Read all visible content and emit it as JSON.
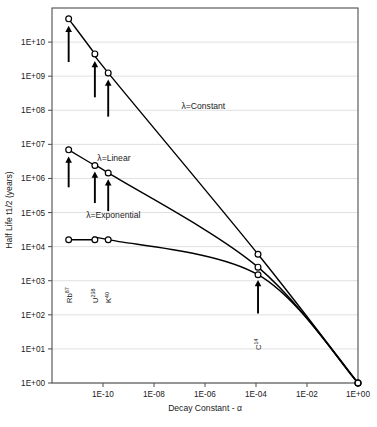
{
  "chart_data": {
    "type": "line",
    "title": "",
    "xlabel": "Decay Constant - α",
    "ylabel": "Half Life t1/2 (years)",
    "xscale": "log",
    "yscale": "log",
    "xlim": [
      1e-12,
      1.0
    ],
    "ylim": [
      1.0,
      100000000000.0
    ],
    "grid": true,
    "grid_axis": "y",
    "legend": "inline-annotations",
    "xticks": [
      "1E-10",
      "1E-08",
      "1E-06",
      "1E-04",
      "1E-02",
      "1E+00"
    ],
    "xtick_values": [
      1e-10,
      1e-08,
      1e-06,
      0.0001,
      0.01,
      1.0
    ],
    "yticks": [
      "1E+00",
      "1E+01",
      "1E+02",
      "1E+03",
      "1E+04",
      "1E+05",
      "1E+06",
      "1E+07",
      "1E+08",
      "1E+09",
      "1E+10"
    ],
    "ytick_values": [
      1,
      10,
      100,
      1000,
      10000,
      100000,
      1000000,
      10000000,
      100000000,
      1000000000,
      10000000000
    ],
    "series": [
      {
        "name": "λ=Constant",
        "label": "λ=Constant",
        "label_x": 1.2e-07,
        "label_y": 110000000.0,
        "marker": "open-circle",
        "points": [
          {
            "x": 4.5e-12,
            "y": 48000000000.0
          },
          {
            "x": 4.8e-11,
            "y": 4500000000.0
          },
          {
            "x": 1.6e-10,
            "y": 1250000000.0
          },
          {
            "x": 0.00012,
            "y": 6000.0
          },
          {
            "x": 1.0,
            "y": 1.0
          }
        ]
      },
      {
        "name": "λ=Linear",
        "label": "λ=Linear",
        "label_x": 6e-11,
        "label_y": 3200000.0,
        "marker": "open-circle",
        "points": [
          {
            "x": 4.5e-12,
            "y": 6900000.0
          },
          {
            "x": 4.8e-11,
            "y": 2400000.0
          },
          {
            "x": 1.6e-10,
            "y": 1450000.0
          },
          {
            "x": 0.00012,
            "y": 2500.0
          },
          {
            "x": 1.0,
            "y": 1.0
          }
        ]
      },
      {
        "name": "λ=Exponential",
        "label": "λ=Exponential",
        "label_x": 2.2e-11,
        "label_y": 70000.0,
        "marker": "open-circle",
        "points": [
          {
            "x": 4.5e-12,
            "y": 16000.0
          },
          {
            "x": 4.8e-11,
            "y": 16000.0
          },
          {
            "x": 1.6e-10,
            "y": 16000.0
          },
          {
            "x": 0.00012,
            "y": 1500.0
          },
          {
            "x": 1.0,
            "y": 1.0
          }
        ]
      }
    ],
    "annotations": [
      {
        "element": "Rb",
        "mass": "87",
        "label": "Rb87",
        "x": 4.5e-12,
        "arrow_to_y": 30000000000.0,
        "arrow_from_y": 2600000000.0
      },
      {
        "element": "U",
        "mass": "238",
        "label": "U238",
        "x": 4.8e-11,
        "arrow_to_y": 2800000000.0,
        "arrow_from_y": 240000000.0
      },
      {
        "element": "K",
        "mass": "40",
        "label": "K40",
        "x": 1.6e-10,
        "arrow_to_y": 800000000.0,
        "arrow_from_y": 65000000.0
      },
      {
        "element": "Rb",
        "mass": "87",
        "label": "Rb87",
        "x": 4.5e-12,
        "arrow_to_y": 4400000.0,
        "arrow_from_y": 550000.0
      },
      {
        "element": "U",
        "mass": "238",
        "label": "U238",
        "x": 4.8e-11,
        "arrow_to_y": 1600000.0,
        "arrow_from_y": 190000.0
      },
      {
        "element": "K",
        "mass": "40",
        "label": "K40",
        "x": 1.6e-10,
        "arrow_to_y": 950000.0,
        "arrow_from_y": 110000.0
      },
      {
        "element": "C",
        "mass": "14",
        "label": "C14",
        "x": 0.00012,
        "arrow_to_y": 1050.0,
        "arrow_from_y": 110.0
      }
    ],
    "isotope_labels": [
      {
        "label": "Rb",
        "mass": "87",
        "x": 4.5e-12
      },
      {
        "label": "U",
        "mass": "238",
        "x": 4.8e-11
      },
      {
        "label": "K",
        "mass": "40",
        "x": 1.6e-10
      },
      {
        "label": "C",
        "mass": "14",
        "x": 0.00012
      }
    ],
    "colors": {
      "line": "#000000",
      "marker_fill": "#ffffff",
      "marker_stroke": "#000000",
      "grid": "#d8d8d8",
      "axis": "#4d4d4d",
      "background": "#ffffff",
      "text": "#1a1a1a"
    }
  }
}
